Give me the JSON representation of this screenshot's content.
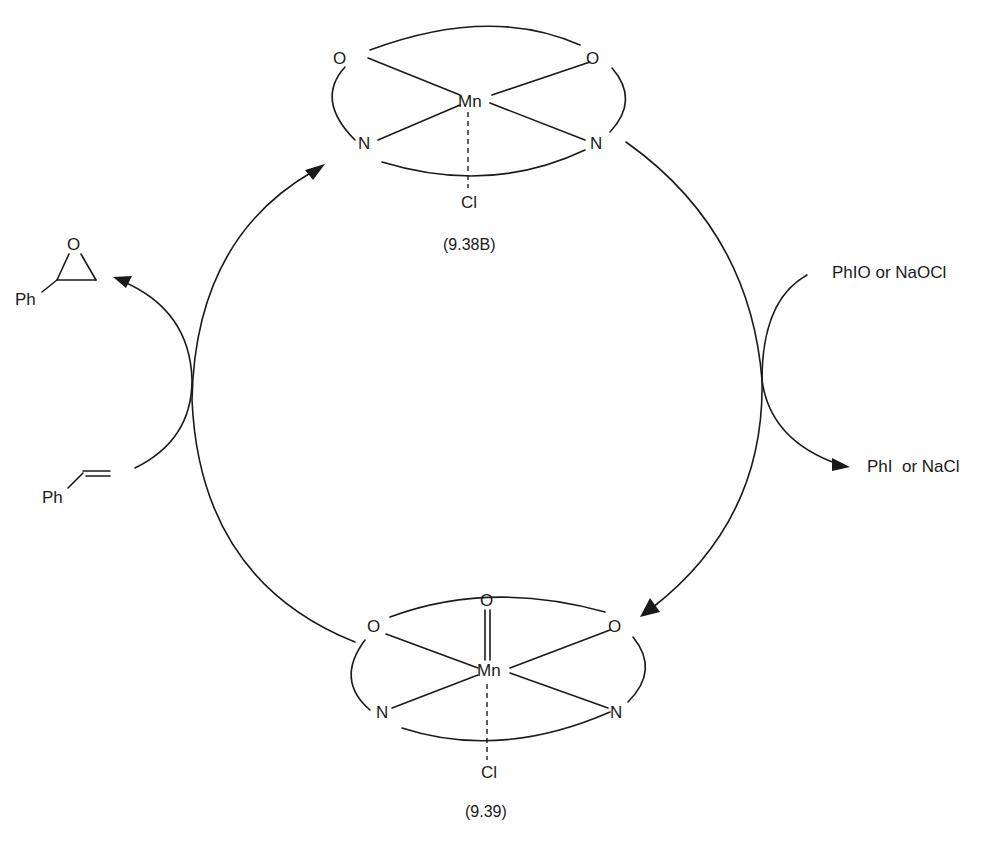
{
  "diagram": {
    "type": "catalytic-cycle",
    "top_complex": {
      "metal": "Mn",
      "ligand_atoms": {
        "o_left": "O",
        "o_right": "O",
        "n_left": "N",
        "n_right": "N"
      },
      "axial": "Cl",
      "label": "(9.38B)"
    },
    "bottom_complex": {
      "metal": "Mn",
      "oxo": "O",
      "ligand_atoms": {
        "o_left": "O",
        "o_right": "O",
        "n_left": "N",
        "n_right": "N"
      },
      "axial": "Cl",
      "label": "(9.39)"
    },
    "left_side": {
      "substrate": {
        "group": "Ph",
        "name": "styrene"
      },
      "product": {
        "group": "Ph",
        "ring_atom": "O",
        "name": "styrene oxide"
      }
    },
    "right_side": {
      "oxidant": "PhIO or NaOCl",
      "byproduct": "PhI  or NaCl"
    }
  }
}
